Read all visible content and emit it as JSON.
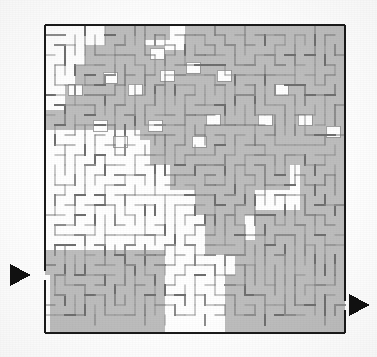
{
  "figure": {
    "kind": "maze-puzzle",
    "background_color": "#ffffff"
  },
  "colors": {
    "paper": "#ffffff",
    "border": "#1a1a1a",
    "wall": "#8d8d8d",
    "wall_dark": "#6f6f6f",
    "shade": "#bdbdbd",
    "shade_edge": "#9a9a9a",
    "arrow": "#111111"
  },
  "maze": {
    "left": 45,
    "top": 25,
    "right": 345,
    "bottom": 333,
    "cols": 30,
    "rows": 30,
    "cell": 10,
    "border_width": 2.2,
    "wall_width": 1.0,
    "label": "maze-grid"
  },
  "entrance": {
    "name": "entrance-arrow",
    "side": "left",
    "x": 10,
    "y": 275,
    "size": 11,
    "direction": "right",
    "gap_y": 275,
    "label": "entrance"
  },
  "exit": {
    "name": "exit-arrow",
    "side": "right",
    "x": 349,
    "y": 305,
    "size": 11,
    "direction": "right",
    "gap_y": 305,
    "label": "exit"
  },
  "shaded_regions": [
    {
      "x": 105,
      "y": 25,
      "w": 40,
      "h": 20
    },
    {
      "x": 85,
      "y": 45,
      "w": 80,
      "h": 20
    },
    {
      "x": 75,
      "y": 65,
      "w": 110,
      "h": 20
    },
    {
      "x": 65,
      "y": 85,
      "w": 130,
      "h": 25
    },
    {
      "x": 45,
      "y": 110,
      "w": 95,
      "h": 20
    },
    {
      "x": 145,
      "y": 25,
      "w": 25,
      "h": 15
    },
    {
      "x": 185,
      "y": 25,
      "w": 160,
      "h": 25
    },
    {
      "x": 165,
      "y": 50,
      "w": 180,
      "h": 30
    },
    {
      "x": 155,
      "y": 80,
      "w": 190,
      "h": 30
    },
    {
      "x": 140,
      "y": 110,
      "w": 205,
      "h": 30
    },
    {
      "x": 150,
      "y": 140,
      "w": 195,
      "h": 25
    },
    {
      "x": 170,
      "y": 165,
      "w": 120,
      "h": 25
    },
    {
      "x": 195,
      "y": 190,
      "w": 60,
      "h": 25
    },
    {
      "x": 205,
      "y": 215,
      "w": 40,
      "h": 40
    },
    {
      "x": 300,
      "y": 165,
      "w": 45,
      "h": 55
    },
    {
      "x": 255,
      "y": 210,
      "w": 90,
      "h": 30
    },
    {
      "x": 235,
      "y": 240,
      "w": 110,
      "h": 35
    },
    {
      "x": 225,
      "y": 275,
      "w": 120,
      "h": 58
    },
    {
      "x": 45,
      "y": 250,
      "w": 120,
      "h": 25
    },
    {
      "x": 50,
      "y": 275,
      "w": 115,
      "h": 58
    }
  ],
  "white_pockets": [
    {
      "x": 150,
      "y": 48,
      "w": 14,
      "h": 11
    },
    {
      "x": 186,
      "y": 62,
      "w": 14,
      "h": 11
    },
    {
      "x": 103,
      "y": 72,
      "w": 14,
      "h": 11
    },
    {
      "x": 160,
      "y": 70,
      "w": 14,
      "h": 11
    },
    {
      "x": 217,
      "y": 70,
      "w": 14,
      "h": 11
    },
    {
      "x": 68,
      "y": 84,
      "w": 14,
      "h": 11
    },
    {
      "x": 128,
      "y": 84,
      "w": 14,
      "h": 11
    },
    {
      "x": 274,
      "y": 84,
      "w": 14,
      "h": 11
    },
    {
      "x": 93,
      "y": 120,
      "w": 14,
      "h": 11
    },
    {
      "x": 148,
      "y": 120,
      "w": 14,
      "h": 11
    },
    {
      "x": 206,
      "y": 114,
      "w": 14,
      "h": 11
    },
    {
      "x": 258,
      "y": 114,
      "w": 14,
      "h": 11
    },
    {
      "x": 298,
      "y": 114,
      "w": 14,
      "h": 11
    },
    {
      "x": 113,
      "y": 136,
      "w": 14,
      "h": 11
    },
    {
      "x": 192,
      "y": 136,
      "w": 14,
      "h": 11
    },
    {
      "x": 326,
      "y": 126,
      "w": 14,
      "h": 11
    }
  ],
  "legend": {
    "entrance_label": "entrance",
    "exit_label": "exit",
    "figure_label": "maze"
  }
}
